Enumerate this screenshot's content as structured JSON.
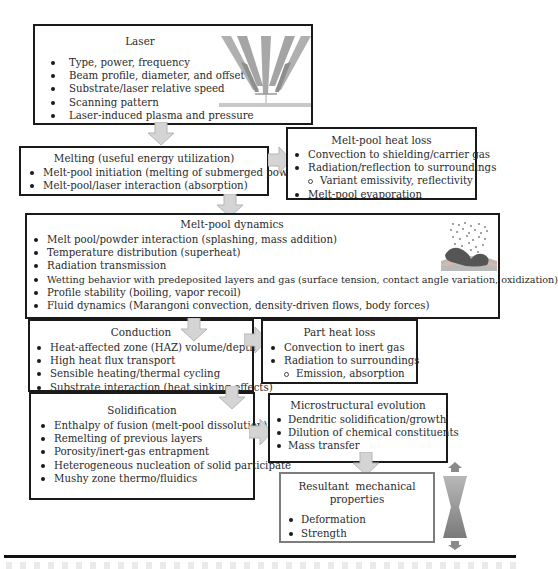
{
  "laser": {
    "title": "Laser",
    "items": [
      "Type, power, frequency",
      "Beam profile, diameter, and offset",
      "Substrate/laser relative speed",
      "Scanning pattern",
      "Laser-induced plasma and pressure"
    ],
    "illustration": "laser-nozzle-beams-icon"
  },
  "melting": {
    "title": "Melting (useful energy utilization)",
    "items": [
      "Melt-pool initiation (melting of submerged powder)",
      "Melt-pool/laser interaction (absorption)"
    ]
  },
  "melt_pool_heat_loss": {
    "title": "Melt-pool heat loss",
    "items": [
      "Convection to shielding/carrier gas",
      "Radiation/reflection to surroundings",
      "Variant emissivity, reflectivity",
      "Melt-pool evaporation"
    ]
  },
  "melt_pool_dynamics": {
    "title": "Melt-pool dynamics",
    "items": [
      "Melt pool/powder interaction (splashing, mass addition)",
      "Temperature distribution (superheat)",
      "Radiation transmission",
      "Wetting behavior with predeposited layers and gas (surface tension, contact angle variation, oxidization)",
      "Profile stability (boiling, vapor recoil)",
      "Fluid dynamics (Marangoni convection, density-driven flows, body forces)"
    ],
    "illustration": "melt-pool-powder-icon"
  },
  "conduction": {
    "title": "Conduction",
    "items": [
      "Heat-affected zone (HAZ) volume/depth",
      "High heat flux transport",
      "Sensible heating/thermal cycling",
      "Substrate interaction (heat sinking effects)"
    ]
  },
  "part_heat_loss": {
    "title": "Part heat loss",
    "items": [
      "Convection to inert gas",
      "Radiation to surroundings",
      "Emission, absorption"
    ]
  },
  "solidification": {
    "title": "Solidification",
    "items": [
      "Enthalpy of fusion (melt-pool dissolution)",
      "Remelting of previous layers",
      "Porosity/inert-gas entrapment",
      "Heterogeneous nucleation of solid participate",
      "Mushy zone thermo/fluidics"
    ]
  },
  "microstructural_evolution": {
    "title": "Microstructural evolution",
    "items": [
      "Dendritic solidification/growth",
      "Dilution of chemical constituents",
      "Mass transfer"
    ]
  },
  "mechanical_properties": {
    "title_line1": "Resultant  mechanical",
    "title_line2": "properties",
    "items": [
      "Deformation",
      "Strength"
    ]
  },
  "colors": {
    "border": "#1a1a1a",
    "arrow_fill": "#d4d4d4",
    "beam_gray": "#a8a8a8"
  }
}
